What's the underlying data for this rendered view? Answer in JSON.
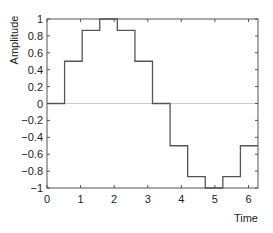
{
  "chart_data": {
    "type": "line",
    "style": "stairs",
    "title": "",
    "xlabel": "Time",
    "ylabel": "Amplitude",
    "xlim": [
      0,
      6.2832
    ],
    "ylim": [
      -1,
      1
    ],
    "xticks": [
      0,
      1,
      2,
      3,
      4,
      5,
      6
    ],
    "xtick_labels": [
      "0",
      "1",
      "2",
      "3",
      "4",
      "5",
      "6"
    ],
    "yticks": [
      1,
      0.8,
      0.6,
      0.4,
      0.2,
      0,
      -0.2,
      -0.4,
      -0.6,
      -0.8,
      -1
    ],
    "ytick_labels": [
      "1",
      "0.8",
      "0.6",
      "0.4",
      "0.2",
      "0",
      "−0.2",
      "−0.4",
      "−0.6",
      "−0.8",
      "−1"
    ],
    "grid": false,
    "zero_line": true,
    "legend": null,
    "series": [
      {
        "name": "sampled sine",
        "color": "#555555",
        "x": [
          0,
          0.5236,
          1.0472,
          1.5708,
          2.0944,
          2.618,
          3.1416,
          3.6652,
          4.1888,
          4.7124,
          5.236,
          5.7596
        ],
        "values": [
          0,
          0.5,
          0.866,
          1,
          0.866,
          0.5,
          0,
          -0.5,
          -0.866,
          -1,
          -0.866,
          -0.5
        ]
      }
    ]
  },
  "colors": {
    "axes": "#555555",
    "line": "#555555",
    "zero_line": "#cccccc"
  }
}
